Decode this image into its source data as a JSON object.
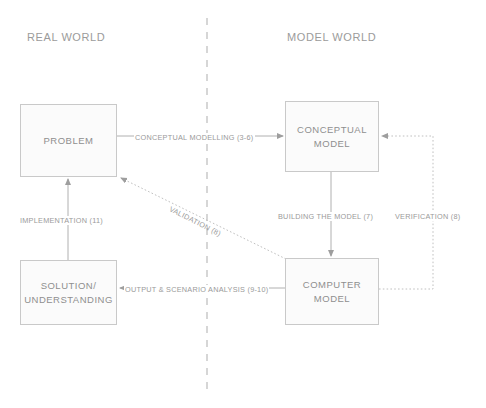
{
  "diagram": {
    "zones": [
      {
        "id": "real-world",
        "label": "REAL WORLD",
        "x": 27,
        "y": 31
      },
      {
        "id": "model-world",
        "label": "MODEL WORLD",
        "x": 287,
        "y": 31
      }
    ],
    "divider": {
      "name": "world-divider",
      "x": 207,
      "y1": 18,
      "y2": 392,
      "style": "dashed",
      "color": "#b5b5b5"
    },
    "nodes": [
      {
        "id": "problem",
        "label": "PROBLEM",
        "x": 20,
        "y": 104,
        "w": 97,
        "h": 73
      },
      {
        "id": "conceptual-model",
        "label": "CONCEPTUAL\nMODEL",
        "x": 285,
        "y": 101,
        "w": 94,
        "h": 71
      },
      {
        "id": "solution-understanding",
        "label": "SOLUTION/\nUNDERSTANDING",
        "x": 20,
        "y": 260,
        "w": 97,
        "h": 65
      },
      {
        "id": "computer-model",
        "label": "COMPUTER\nMODEL",
        "x": 285,
        "y": 258,
        "w": 94,
        "h": 67
      }
    ],
    "edges": [
      {
        "id": "conceptual-modelling",
        "label": "CONCEPTUAL MODELLING (3-6)",
        "from": "problem",
        "to": "conceptual-model",
        "style": "solid",
        "label_x": 134,
        "label_y": 133
      },
      {
        "id": "building-the-model",
        "label": "BUILDING THE MODEL (7)",
        "from": "conceptual-model",
        "to": "computer-model",
        "style": "solid",
        "label_x": 277,
        "label_y": 212
      },
      {
        "id": "verification",
        "label": "VERIFICATION (8)",
        "from": "computer-model",
        "to": "conceptual-model",
        "style": "dotted",
        "label_x": 394,
        "label_y": 212
      },
      {
        "id": "validation",
        "label": "VALIDATION (8)",
        "from": "computer-model",
        "to": "problem",
        "style": "dotted",
        "label_x": 171,
        "label_y": 204,
        "rotation": 27
      },
      {
        "id": "output-scenario-analysis",
        "label": "OUTPUT & SCENARIO ANALYSIS (9-10)",
        "from": "computer-model",
        "to": "solution-understanding",
        "style": "solid",
        "label_x": 124,
        "label_y": 285
      },
      {
        "id": "implementation",
        "label": "IMPLEMENTATION (11)",
        "from": "solution-understanding",
        "to": "problem",
        "style": "solid",
        "label_x": 19,
        "label_y": 216
      }
    ],
    "colors": {
      "line": "#b0b0b0",
      "dotted_line": "#c0c0c0",
      "box_border": "#c9c9c9",
      "box_fill": "#fbfbfb",
      "text": "#9a9a9a",
      "divider": "#b5b5b5"
    }
  }
}
